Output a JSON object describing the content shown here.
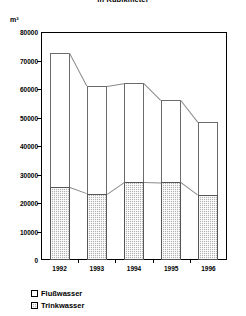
{
  "chart_data": {
    "type": "bar",
    "title": "in Kubikmeter",
    "xlabel": "",
    "ylabel": "m³",
    "categories": [
      "1992",
      "1993",
      "1994",
      "1995",
      "1996"
    ],
    "ylim": [
      0,
      80000
    ],
    "yticks": [
      0,
      10000,
      20000,
      30000,
      40000,
      50000,
      60000,
      70000,
      80000
    ],
    "ytick_labels": [
      "0",
      "10000",
      "20000",
      "30000",
      "40000",
      "50000",
      "60000",
      "70000",
      "80000"
    ],
    "grid": false,
    "stacked": true,
    "legend_position": "bottom-left",
    "series": [
      {
        "name": "Flußwasser",
        "fill": "white",
        "values": [
          47000,
          37700,
          34500,
          28700,
          25500
        ]
      },
      {
        "name": "Trinkwasser",
        "fill": "hatched-gray",
        "values": [
          25500,
          23300,
          27500,
          27300,
          22800
        ]
      }
    ],
    "totals": [
      72500,
      61000,
      62000,
      56000,
      48300
    ],
    "colors": {
      "flusswasser": "#ffffff",
      "trinkwasser": "#b3b3b3",
      "axis": "#000000",
      "outline": "#6b6b6b"
    }
  },
  "legend": {
    "items": [
      {
        "label": "Flußwasser",
        "swatch": "empty-square-icon"
      },
      {
        "label": "Trinkwasser",
        "swatch": "hatched-square-icon"
      }
    ]
  }
}
